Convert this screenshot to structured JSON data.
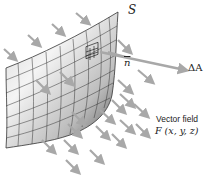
{
  "diagram": {
    "surface_label": "S",
    "normal_label": "n",
    "area_vector_label": "ΔA",
    "field_title": "Vector field",
    "field_expr": "F (x, y, z)",
    "colors": {
      "arrow": "#a8a8a8",
      "surface_light": "#f2f2f2",
      "surface_dark": "#6a6a6a",
      "grid": "#333333",
      "text": "#222222"
    }
  }
}
